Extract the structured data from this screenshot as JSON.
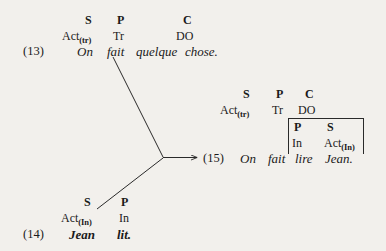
{
  "figure": {
    "background_color": "#f2f0ec",
    "ink_color": "#1a1a1a",
    "examples": [
      {
        "number": "(13)",
        "sentence": "On fait quelque chose.",
        "columns": [
          {
            "function": "S",
            "category": "Act",
            "subscript": "(tr)",
            "word": "On"
          },
          {
            "function": "P",
            "category": "Tr",
            "subscript": "",
            "word": "fait"
          },
          {
            "function": "C",
            "category": "DO",
            "subscript": "",
            "word": "quelque chose."
          }
        ]
      },
      {
        "number": "(14)",
        "sentence": "Jean lit.",
        "columns": [
          {
            "function": "S",
            "category": "Act",
            "subscript": "(In)",
            "word": "Jean"
          },
          {
            "function": "P",
            "category": "In",
            "subscript": "",
            "word": "lit."
          }
        ]
      },
      {
        "number": "(15)",
        "sentence": "On fait lire Jean.",
        "columns": [
          {
            "function": "S",
            "category": "Act",
            "subscript": "(tr)",
            "word": "On"
          },
          {
            "function": "P",
            "category": "Tr",
            "subscript": "",
            "word": "fait"
          },
          {
            "function": "C",
            "category": "DO",
            "subscript": "",
            "word": ""
          }
        ],
        "embedded_clause": {
          "columns": [
            {
              "function": "P",
              "category": "In",
              "subscript": "",
              "word": "lire"
            },
            {
              "function": "S",
              "category": "Act",
              "subscript": "(In)",
              "word": "Jean."
            }
          ]
        }
      }
    ],
    "labels": {
      "ex13_S": "S",
      "ex13_P": "P",
      "ex13_C": "C",
      "ex13_Act": "Act",
      "ex13_Act_sub": "(tr)",
      "ex13_Tr": "Tr",
      "ex13_DO": "DO",
      "ex13_num": "(13)",
      "ex13_w1": "On",
      "ex13_w2": "fait",
      "ex13_w3": "quelque",
      "ex13_w4": "chose.",
      "ex14_S": "S",
      "ex14_P": "P",
      "ex14_Act": "Act",
      "ex14_Act_sub": "(In)",
      "ex14_In": "In",
      "ex14_num": "(14)",
      "ex14_w1": "Jean",
      "ex14_w2": "lit.",
      "ex15_S": "S",
      "ex15_P": "P",
      "ex15_C": "C",
      "ex15_Act": "Act",
      "ex15_Act_sub": "(tr)",
      "ex15_Tr": "Tr",
      "ex15_DO": "DO",
      "ex15_num": "(15)",
      "ex15_w1": "On",
      "ex15_w2": "fait",
      "ex15_box_P": "P",
      "ex15_box_S": "S",
      "ex15_box_In": "In",
      "ex15_box_Act": "Act",
      "ex15_box_Act_sub": "(In)",
      "ex15_w3": "lire",
      "ex15_w4": "Jean."
    }
  }
}
